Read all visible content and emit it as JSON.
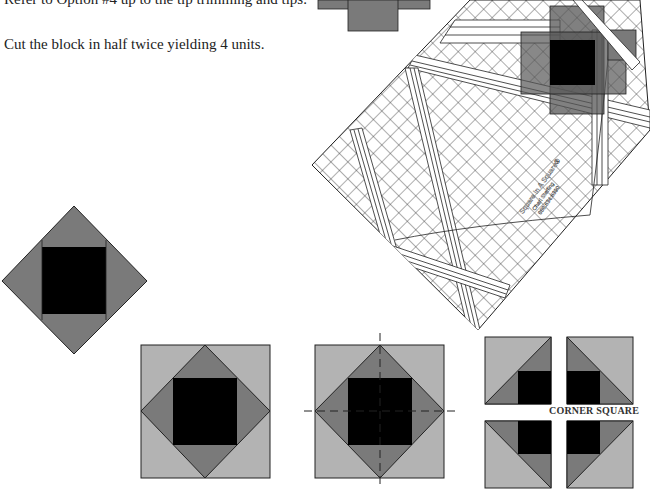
{
  "instructions": {
    "step_refer": "Refer to Option #4 up to the tip trimming and tips.",
    "step_cut": "Cut the block in half twice yielding 4 units."
  },
  "ruler": {
    "brand_line": "Square In A Square®",
    "name_line": "Chari Sterling",
    "phone_line": "888.634.6390"
  },
  "labels": {
    "corner_square": "CORNER SQUARE"
  },
  "colors": {
    "light_gray": "#b3b3b3",
    "mid_gray": "#7a7a7a",
    "center": "#000000",
    "outline": "#222222"
  }
}
